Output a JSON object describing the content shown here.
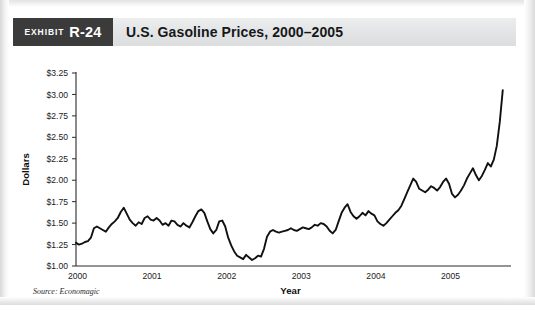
{
  "exhibit": {
    "kicker": "EXHIBIT",
    "number": "R-24",
    "title": "U.S. Gasoline Prices, 2000–2005",
    "source_note": "Source: Economagic"
  },
  "chart_data": {
    "type": "line",
    "title": "U.S. Gasoline Prices, 2000–2005",
    "subtitle": "",
    "xlabel": "Year",
    "ylabel": "Dollars",
    "legend": [],
    "legend_position": "none",
    "grid": false,
    "xlim": [
      2000.0,
      2005.75
    ],
    "ylim": [
      1.0,
      3.25
    ],
    "ytick_labels": [
      "$1.00",
      "$1.25",
      "$1.50",
      "$1.75",
      "$2.00",
      "$2.25",
      "$2.50",
      "$2.75",
      "$3.00",
      "$3.25"
    ],
    "ytick_values": [
      1.0,
      1.25,
      1.5,
      1.75,
      2.0,
      2.25,
      2.5,
      2.75,
      3.0,
      3.25
    ],
    "xtick_labels": [
      "2000",
      "2001",
      "2002",
      "2003",
      "2004",
      "2005"
    ],
    "xtick_values": [
      2000,
      2001,
      2002,
      2003,
      2004,
      2005
    ],
    "line_color": "#111111",
    "line_width": 1.9,
    "series": [
      {
        "name": "U.S. Gasoline Price",
        "x": [
          2000.0,
          2000.04,
          2000.08,
          2000.12,
          2000.16,
          2000.2,
          2000.24,
          2000.28,
          2000.32,
          2000.36,
          2000.4,
          2000.44,
          2000.48,
          2000.52,
          2000.56,
          2000.6,
          2000.64,
          2000.68,
          2000.72,
          2000.76,
          2000.8,
          2000.84,
          2000.88,
          2000.92,
          2000.96,
          2001.0,
          2001.04,
          2001.08,
          2001.12,
          2001.16,
          2001.2,
          2001.24,
          2001.28,
          2001.32,
          2001.36,
          2001.4,
          2001.44,
          2001.48,
          2001.52,
          2001.56,
          2001.6,
          2001.64,
          2001.68,
          2001.72,
          2001.76,
          2001.8,
          2001.84,
          2001.88,
          2001.92,
          2001.96,
          2002.0,
          2002.04,
          2002.08,
          2002.12,
          2002.16,
          2002.2,
          2002.24,
          2002.28,
          2002.32,
          2002.36,
          2002.4,
          2002.44,
          2002.48,
          2002.52,
          2002.56,
          2002.6,
          2002.64,
          2002.68,
          2002.72,
          2002.76,
          2002.8,
          2002.84,
          2002.88,
          2002.92,
          2002.96,
          2003.0,
          2003.04,
          2003.08,
          2003.12,
          2003.16,
          2003.2,
          2003.24,
          2003.28,
          2003.32,
          2003.36,
          2003.4,
          2003.44,
          2003.48,
          2003.52,
          2003.56,
          2003.6,
          2003.64,
          2003.68,
          2003.72,
          2003.76,
          2003.8,
          2003.84,
          2003.88,
          2003.92,
          2003.96,
          2004.0,
          2004.04,
          2004.08,
          2004.12,
          2004.16,
          2004.2,
          2004.24,
          2004.28,
          2004.32,
          2004.36,
          2004.4,
          2004.44,
          2004.48,
          2004.52,
          2004.56,
          2004.6,
          2004.64,
          2004.68,
          2004.72,
          2004.76,
          2004.8,
          2004.84,
          2004.88,
          2004.92,
          2004.96,
          2005.0,
          2005.04,
          2005.08,
          2005.12,
          2005.16,
          2005.2,
          2005.24,
          2005.28,
          2005.32,
          2005.36,
          2005.4,
          2005.44,
          2005.48,
          2005.52,
          2005.56,
          2005.6,
          2005.64,
          2005.68,
          2005.72
        ],
        "y": [
          1.27,
          1.25,
          1.26,
          1.28,
          1.29,
          1.33,
          1.44,
          1.46,
          1.44,
          1.42,
          1.4,
          1.45,
          1.49,
          1.52,
          1.56,
          1.63,
          1.68,
          1.61,
          1.54,
          1.5,
          1.47,
          1.51,
          1.49,
          1.56,
          1.58,
          1.54,
          1.53,
          1.56,
          1.53,
          1.48,
          1.5,
          1.47,
          1.53,
          1.52,
          1.48,
          1.46,
          1.5,
          1.47,
          1.45,
          1.51,
          1.58,
          1.64,
          1.66,
          1.62,
          1.52,
          1.43,
          1.38,
          1.42,
          1.52,
          1.53,
          1.46,
          1.33,
          1.24,
          1.17,
          1.12,
          1.1,
          1.08,
          1.13,
          1.1,
          1.07,
          1.09,
          1.12,
          1.11,
          1.2,
          1.34,
          1.4,
          1.42,
          1.4,
          1.39,
          1.4,
          1.41,
          1.42,
          1.44,
          1.42,
          1.41,
          1.43,
          1.45,
          1.44,
          1.43,
          1.45,
          1.48,
          1.47,
          1.5,
          1.49,
          1.46,
          1.41,
          1.38,
          1.42,
          1.52,
          1.62,
          1.68,
          1.72,
          1.63,
          1.58,
          1.55,
          1.58,
          1.62,
          1.59,
          1.64,
          1.61,
          1.59,
          1.52,
          1.49,
          1.47,
          1.5,
          1.54,
          1.58,
          1.62,
          1.65,
          1.7,
          1.78,
          1.86,
          1.94,
          2.02,
          1.98,
          1.9,
          1.88,
          1.86,
          1.89,
          1.93,
          1.91,
          1.88,
          1.92,
          1.98,
          2.02,
          1.96,
          1.84,
          1.8,
          1.83,
          1.88,
          1.94,
          2.02,
          2.08,
          2.14,
          2.06,
          2.0,
          2.05,
          2.12,
          2.2,
          2.16,
          2.24,
          2.4,
          2.68,
          3.05
        ]
      }
    ],
    "annotations": [
      {
        "text": "Source: Economagic",
        "position": "below-axis-left"
      }
    ]
  }
}
